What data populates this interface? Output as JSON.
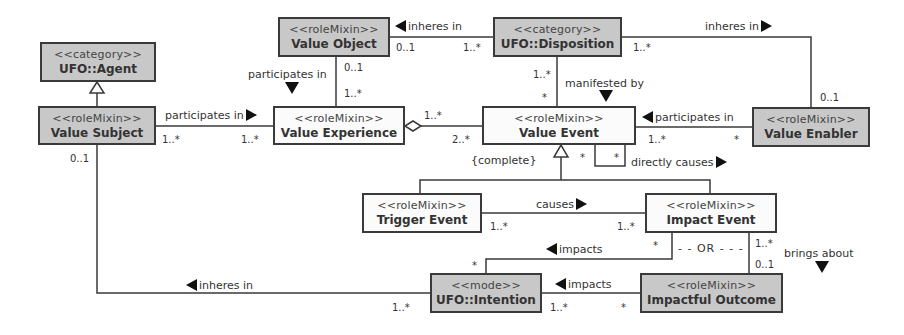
{
  "diagram": {
    "classes": {
      "ufo_agent": {
        "stereotype": "<<category>>",
        "name": "UFO::Agent"
      },
      "value_subject": {
        "stereotype": "<<roleMixin>>",
        "name": "Value Subject"
      },
      "value_object": {
        "stereotype": "<<roleMixin>>",
        "name": "Value Object"
      },
      "ufo_disposition": {
        "stereotype": "<<category>>",
        "name": "UFO::Disposition"
      },
      "value_experience": {
        "stereotype": "<<roleMixin>>",
        "name": "Value Experience"
      },
      "value_event": {
        "stereotype": "<<roleMixin>>",
        "name": "Value Event"
      },
      "value_enabler": {
        "stereotype": "<<roleMixin>>",
        "name": "Value Enabler"
      },
      "trigger_event": {
        "stereotype": "<<roleMixin>>",
        "name": "Trigger Event"
      },
      "impact_event": {
        "stereotype": "<<roleMixin>>",
        "name": "Impact Event"
      },
      "ufo_intention": {
        "stereotype": "<<mode>>",
        "name": "UFO::Intention"
      },
      "impactful_outcome": {
        "stereotype": "<<roleMixin>>",
        "name": "Impactful Outcome"
      }
    },
    "associations": {
      "vo_inheres_disp": {
        "label": "inheres in",
        "src_mult": "0..1",
        "tgt_mult": "1..*"
      },
      "disp_inheres_enabler": {
        "label": "inheres in",
        "src_mult": "1..*",
        "tgt_mult": "0..1"
      },
      "vo_participates_vexp": {
        "label": "participates in",
        "src_mult": "0..1",
        "tgt_mult": "1..*"
      },
      "vs_participates_vexp": {
        "label": "participates in",
        "src_mult": "1..*",
        "tgt_mult": "1..*"
      },
      "vexp_aggregates_vevent": {
        "src_mult": "1..*",
        "tgt_mult": "2..*"
      },
      "disp_manifested_vevent": {
        "label": "manifested by",
        "src_mult": "1..*",
        "tgt_mult": "*"
      },
      "enabler_participates_vevent": {
        "label": "participates in",
        "src_mult": "1..*",
        "tgt_mult": "*"
      },
      "vevent_directly_causes": {
        "label": "directly causes",
        "src_mult": "*",
        "tgt_mult": "*"
      },
      "generalization_set": {
        "label": "{complete}"
      },
      "trigger_causes_impact": {
        "label": "causes",
        "src_mult": "1..*",
        "tgt_mult": "1..*"
      },
      "impact_impacts_intention": {
        "label": "impacts",
        "src_mult": "*",
        "tgt_mult": "*"
      },
      "outcome_impacts_intention": {
        "label": "impacts",
        "src_mult": "*",
        "tgt_mult": "1..*"
      },
      "impact_brings_outcome": {
        "label": "brings about",
        "src_mult": "1..*",
        "tgt_mult": "0..1"
      },
      "or_constraint": {
        "label": "- - OR - - -"
      },
      "intention_inheres_vs": {
        "label": "inheres in",
        "src_mult": "1..*",
        "tgt_mult": "0..1"
      }
    }
  }
}
